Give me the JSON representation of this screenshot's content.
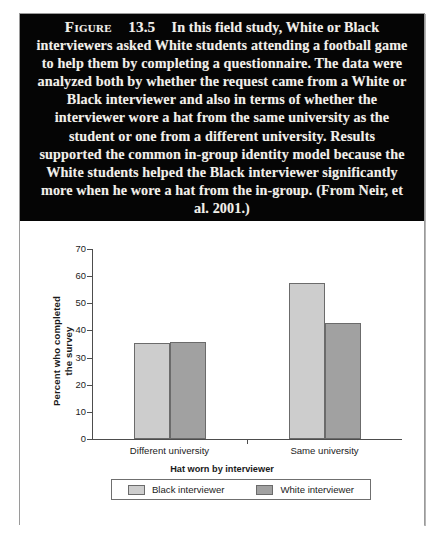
{
  "figure": {
    "label_word": "Figure",
    "number": "13.5",
    "caption": "In this field study, White or Black interviewers asked White students attending a football game to help them by completing a questionnaire. The data were analyzed both by whether the request came from a White or Black interviewer and also in terms of whether the interviewer wore a hat from the same university as the student or one from a different university. Results supported the common in-group identity model because the White students helped the Black interviewer significantly more when he wore a hat from the in-group. (From Neir, et al. 2001.)"
  },
  "colors": {
    "caption_background": "#050505",
    "caption_text": "#f2f0ea",
    "bar_light": "#cdcdcd",
    "bar_dark": "#a1a1a1",
    "axis": "#4d4d4d",
    "frame_border": "#9a9a9a"
  },
  "chart_data": {
    "type": "bar",
    "title": "",
    "xlabel": "Hat worn by interviewer",
    "ylabel": "Percent who completed the survey",
    "ylabel_lines": [
      "Percent who completed",
      "the survey"
    ],
    "categories": [
      "Different university",
      "Same university"
    ],
    "series": [
      {
        "name": "Black interviewer",
        "values": [
          35.5,
          57.3
        ],
        "color": "#cdcdcd"
      },
      {
        "name": "White interviewer",
        "values": [
          35.7,
          42.8
        ],
        "color": "#a1a1a1"
      }
    ],
    "ylim": [
      0,
      70
    ],
    "yticks": [
      70,
      60,
      50,
      40,
      30,
      20,
      10,
      0
    ],
    "ytick_labels": [
      "70",
      "60",
      "50",
      "40",
      "30",
      "20",
      "10",
      "0"
    ],
    "grid": false,
    "legend_position": "bottom",
    "legend_title": "Hat worn by interviewer"
  }
}
